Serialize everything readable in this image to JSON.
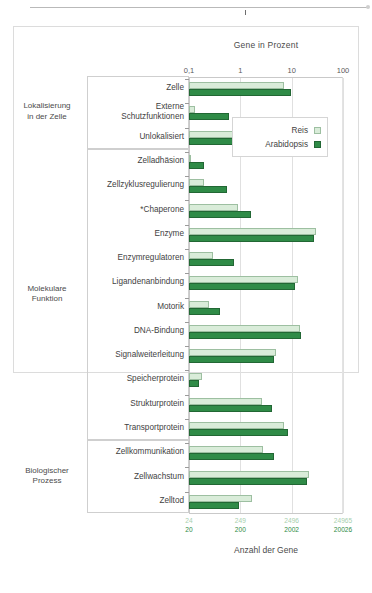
{
  "figure": {
    "title_top": "Gene in Prozent",
    "title_bottom": "Anzahl der Gene"
  },
  "legend": {
    "position": "inside-top-right",
    "items": [
      {
        "label": "Reis",
        "color": "#d9ecd9"
      },
      {
        "label": "Arabidopsis",
        "color": "#2f8b47"
      }
    ]
  },
  "groups": [
    {
      "label": "Lokalisierung\nin der Zelle",
      "line1": "Lokalisierung",
      "line2": "in der Zelle"
    },
    {
      "label": "Molekulare\nFunktion",
      "line1": "Molekulare",
      "line2": "Funktion"
    },
    {
      "label": "Biologischer\nProzess",
      "line1": "Biologischer",
      "line2": "Prozess"
    }
  ],
  "axis_top": {
    "ticks": [
      "0,1",
      "1",
      "10",
      "100"
    ],
    "values": [
      0.1,
      1,
      10,
      100
    ]
  },
  "axis_bottom": {
    "reis_ticks": [
      "24",
      "249",
      "2496",
      "24965"
    ],
    "arabidopsis_ticks": [
      "20",
      "200",
      "2002",
      "20026"
    ]
  },
  "chart_data": {
    "type": "bar",
    "orientation": "horizontal",
    "scale": "log",
    "title": "Gene in Prozent",
    "xlabel": "Anzahl der Gene",
    "ylabel": "",
    "xlim": [
      0.1,
      100
    ],
    "grid": true,
    "legend_position": "top-right",
    "categories": [
      "Zelle",
      "Externe Schutzfunktionen",
      "Unlokalisiert",
      "Zelladhäsion",
      "Zellzyklusregulierung",
      "*Chaperone",
      "Enzyme",
      "Enzymregulatoren",
      "Ligandenanbindung",
      "Motorik",
      "DNA-Bindung",
      "Signalweiterleitung",
      "Speicherprotein",
      "Strukturprotein",
      "Transportprotein",
      "Zellkommunikation",
      "Zellwachstum",
      "Zelltod"
    ],
    "category_lines": [
      [
        "Zelle"
      ],
      [
        "Externe",
        "Schutzfunktionen"
      ],
      [
        "Unlokalisiert"
      ],
      [
        "Zelladhäsion"
      ],
      [
        "Zellzyklusregulierung"
      ],
      [
        "*Chaperone"
      ],
      [
        "Enzyme"
      ],
      [
        "Enzymregulatoren"
      ],
      [
        "Ligandenanbindung"
      ],
      [
        "Motorik"
      ],
      [
        "DNA-Bindung"
      ],
      [
        "Signalweiterleitung"
      ],
      [
        "Speicherprotein"
      ],
      [
        "Strukturprotein"
      ],
      [
        "Transportprotein"
      ],
      [
        "Zellkommunikation"
      ],
      [
        "Zellwachstum"
      ],
      [
        "Zelltod"
      ]
    ],
    "group_spans": [
      {
        "name": "Lokalisierung in der Zelle",
        "start": 0,
        "end": 2
      },
      {
        "name": "Molekulare Funktion",
        "start": 3,
        "end": 14
      },
      {
        "name": "Biologischer Prozess",
        "start": 15,
        "end": 17
      }
    ],
    "series": [
      {
        "name": "Reis",
        "color": "#d9ecd9",
        "values": [
          7.0,
          0.13,
          1.6,
          0.1,
          0.2,
          0.9,
          30.0,
          0.3,
          13.0,
          0.24,
          14.5,
          5.0,
          0.18,
          2.6,
          7.0,
          2.8,
          22.0,
          1.7
        ]
      },
      {
        "name": "Arabidopsis",
        "color": "#2f8b47",
        "values": [
          9.5,
          0.6,
          2.4,
          0.2,
          0.55,
          1.6,
          27.0,
          0.75,
          11.5,
          0.4,
          15.5,
          4.5,
          0.16,
          4.2,
          8.5,
          4.6,
          20.0,
          0.95
        ]
      }
    ]
  }
}
